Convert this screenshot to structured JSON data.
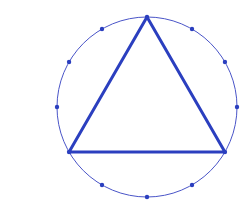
{
  "diagram": {
    "type": "inscribed-equilateral-triangle",
    "circle": {
      "cx": 147,
      "cy": 107,
      "r": 90,
      "color": "#4a55c8",
      "stroke_width": 1
    },
    "divisions": 12,
    "triangle": {
      "vertices_deg": [
        90,
        210,
        330
      ],
      "color": "#2b3fbf",
      "stroke_width": 3
    },
    "dots": {
      "color": "#2b3fbf",
      "radius": 2.2
    }
  }
}
